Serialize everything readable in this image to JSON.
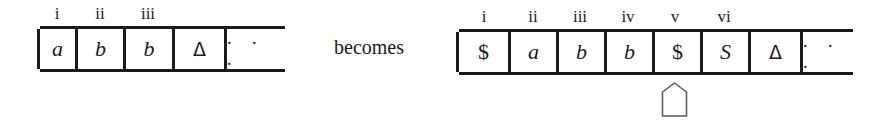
{
  "left_tape": {
    "labels": [
      "i",
      "ii",
      "iii"
    ],
    "cells": [
      "a",
      "b",
      "b",
      "Δ",
      ". . ."
    ]
  },
  "connector": "becomes",
  "right_tape": {
    "labels": [
      "i",
      "ii",
      "iii",
      "iv",
      "v",
      "vi"
    ],
    "cells": [
      "$",
      "a",
      "b",
      "b",
      "$",
      "S",
      "Δ",
      ". . ."
    ],
    "head_position": "v",
    "head_icon": "tape-head-pointer-icon"
  }
}
